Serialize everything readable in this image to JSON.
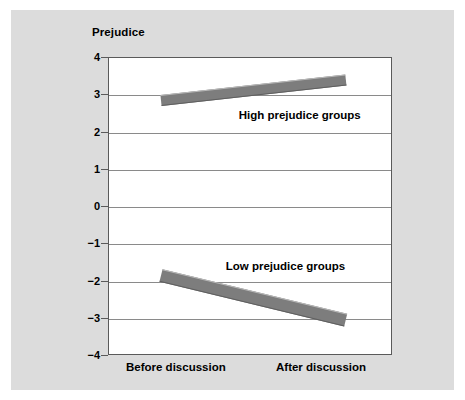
{
  "chart_data": {
    "type": "line",
    "title": "",
    "ylabel": "Prejudice",
    "xlabel": "",
    "categories": [
      "Before discussion",
      "After discussion"
    ],
    "x": [
      0,
      1
    ],
    "ylim": [
      -4,
      4
    ],
    "yticks": [
      "4",
      "3",
      "2",
      "1",
      "0",
      "-1",
      "-2",
      "-3",
      "-4"
    ],
    "ytick_values": [
      4,
      3,
      2,
      1,
      0,
      -1,
      -2,
      -3,
      -4
    ],
    "grid": true,
    "legend_position": "inline-annotation",
    "series": [
      {
        "name": "High prejudice groups",
        "values": [
          2.85,
          3.4
        ]
      },
      {
        "name": "Low prejudice groups",
        "values": [
          -1.85,
          -3.05
        ]
      }
    ],
    "annotations": [
      {
        "text": "High prejudice groups",
        "x": 0.42,
        "y": 2.45
      },
      {
        "text": "Low prejudice groups",
        "x": 0.35,
        "y": -1.6
      }
    ],
    "colors": {
      "series_band": "#7d7d7d",
      "panel_background": "#dcdcdc",
      "plot_background": "#ffffff",
      "gridline": "#8a8a8a",
      "axis": "#5a5a5a",
      "text": "#000000"
    }
  },
  "axis_title": {
    "text": "Prejudice"
  },
  "y_axis": {
    "ticks": [
      {
        "label": "4"
      },
      {
        "label": "3"
      },
      {
        "label": "2"
      },
      {
        "label": "1"
      },
      {
        "label": "0"
      },
      {
        "label": "-1"
      },
      {
        "label": "-2"
      },
      {
        "label": "-3"
      },
      {
        "label": "-4"
      }
    ]
  },
  "x_axis": {
    "ticks": [
      {
        "label": "Before discussion"
      },
      {
        "label": "After discussion"
      }
    ]
  },
  "series_labels": {
    "high": "High prejudice groups",
    "low": "Low prejudice groups"
  }
}
